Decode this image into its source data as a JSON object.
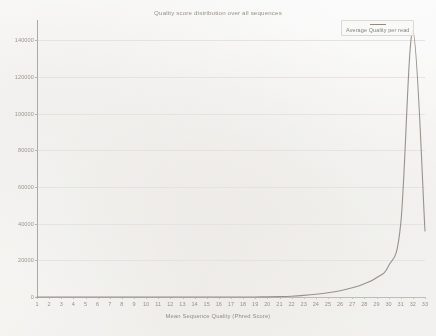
{
  "chart_data": {
    "type": "line",
    "title": "Quality score distribution over all sequences",
    "xlabel": "Mean Sequence Quality (Phred Score)",
    "ylabel": "",
    "xlim": [
      1,
      33
    ],
    "ylim": [
      0,
      150000
    ],
    "grid": true,
    "legend_position": "top-right",
    "series": [
      {
        "name": "Average Quality per read",
        "color": "#8a827a",
        "x": [
          1,
          2,
          3,
          4,
          5,
          6,
          7,
          8,
          9,
          10,
          11,
          12,
          13,
          14,
          15,
          16,
          17,
          18,
          19,
          20,
          21,
          22,
          23,
          24,
          25,
          26,
          27,
          28,
          29,
          30,
          31,
          32,
          33
        ],
        "values": [
          0,
          0,
          0,
          0,
          0,
          0,
          0,
          0,
          0,
          0,
          0,
          0,
          0,
          0,
          0,
          0,
          0,
          10,
          30,
          80,
          200,
          450,
          900,
          1500,
          2300,
          3400,
          5000,
          7200,
          10500,
          17000,
          40000,
          145000,
          36000
        ]
      }
    ],
    "xticks": [
      "1",
      "2",
      "3",
      "4",
      "5",
      "6",
      "7",
      "8",
      "9",
      "10",
      "11",
      "12",
      "13",
      "14",
      "15",
      "16",
      "17",
      "18",
      "19",
      "20",
      "21",
      "22",
      "23",
      "24",
      "25",
      "26",
      "27",
      "28",
      "29",
      "30",
      "31",
      "32",
      "33"
    ],
    "yticks": [
      "0",
      "20000",
      "40000",
      "60000",
      "80000",
      "100000",
      "120000",
      "140000"
    ],
    "ytick_values": [
      0,
      20000,
      40000,
      60000,
      80000,
      100000,
      120000,
      140000
    ]
  },
  "legend": {
    "label": "Average Quality per read"
  }
}
